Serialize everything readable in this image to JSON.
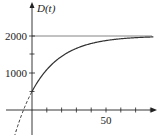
{
  "chart_data": {
    "type": "line",
    "title": "",
    "ylabel": "D(t)",
    "xlabel": "t",
    "y_ticks_labeled": [
      {
        "value": 1000,
        "label": "1000"
      },
      {
        "value": 2000,
        "label": "2000"
      }
    ],
    "y_ticks_minor": [
      500,
      1500
    ],
    "x_ticks_labeled": [
      {
        "value": 50,
        "label": "50"
      }
    ],
    "x_ticks_minor": [
      10,
      20,
      30,
      40,
      60,
      70,
      80
    ],
    "asymptote": {
      "y": 2000
    },
    "xlim": [
      -10,
      85
    ],
    "ylim": [
      -400,
      2350
    ],
    "series": [
      {
        "name": "D(t) = 2000 - 1500e^(-0.05t)",
        "style": "solid",
        "x": [
          0,
          5,
          10,
          15,
          20,
          25,
          30,
          35,
          40,
          45,
          50,
          55,
          60,
          65,
          70,
          75,
          80
        ],
        "values": [
          500,
          832,
          1090,
          1291,
          1448,
          1570,
          1665,
          1739,
          1797,
          1842,
          1877,
          1905,
          1925,
          1942,
          1955,
          1965,
          1973
        ]
      },
      {
        "name": "extension (t<0)",
        "style": "dashed",
        "x": [
          -8,
          -6,
          -4,
          -2,
          0
        ],
        "values": [
          -238,
          -25,
          168,
          342,
          500
        ]
      }
    ]
  },
  "labels": {
    "y_axis": "D(t)",
    "y_2000": "2000",
    "y_1000": "1000",
    "x_50": "50"
  }
}
